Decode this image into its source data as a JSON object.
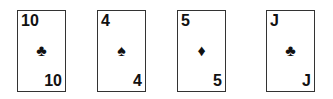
{
  "cards": [
    {
      "rank": "10",
      "suit": "♣",
      "suit_name": "clubs",
      "left": 17
    },
    {
      "rank": "4",
      "suit": "♠",
      "suit_name": "spades",
      "left": 97
    },
    {
      "rank": "5",
      "suit": "♦",
      "suit_name": "diamonds",
      "left": 177
    },
    {
      "rank": "J",
      "suit": "♣",
      "suit_name": "clubs",
      "left": 266
    }
  ],
  "colors": {
    "ink": "#111111",
    "border": "#333333",
    "background": "#ffffff"
  }
}
